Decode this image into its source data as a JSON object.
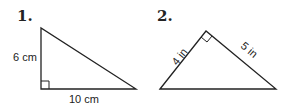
{
  "problems": [
    {
      "number": "1.",
      "shape": "right triangle",
      "right_angle": "bottom-left",
      "labels": {
        "vertical_leg": "6 cm",
        "horizontal_leg": "10 cm"
      }
    },
    {
      "number": "2.",
      "shape": "right triangle",
      "right_angle": "top",
      "labels": {
        "left_leg": "4 in",
        "right_leg": "5 in"
      }
    }
  ],
  "colors": {
    "stroke": "#222222",
    "background": "#ffffff"
  }
}
